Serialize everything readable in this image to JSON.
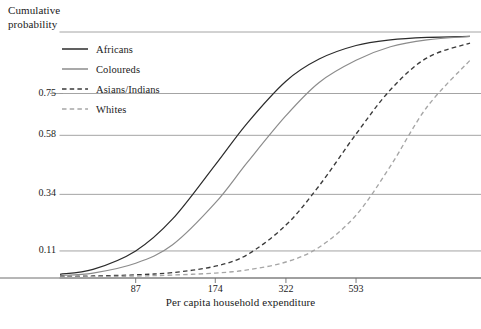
{
  "chart_data": {
    "type": "line",
    "title": "",
    "subtitle": "",
    "ylabel": "Cumulative\nprobability",
    "xlabel": "Per capita household expenditure",
    "grid": true,
    "legend_position": "upper-left-inside",
    "x_scale": "log",
    "x_ticks": [
      87,
      174,
      322,
      593
    ],
    "x_tick_labels": [
      "87",
      "174",
      "322",
      "593"
    ],
    "y_ticks": [
      0.11,
      0.34,
      0.58,
      0.75
    ],
    "y_tick_labels": [
      "0.11",
      "0.34",
      "0.58",
      "0.75"
    ],
    "ylim": [
      0,
      1.0
    ],
    "xlim": [
      45,
      1600
    ],
    "annotations": [],
    "series": [
      {
        "name": "Africans",
        "style": "solid",
        "color": "#2b2b2b",
        "x": [
          45,
          60,
          87,
          120,
          174,
          230,
          322,
          430,
          593,
          800,
          1100,
          1600
        ],
        "y": [
          0.015,
          0.035,
          0.11,
          0.24,
          0.46,
          0.63,
          0.8,
          0.89,
          0.945,
          0.968,
          0.978,
          0.982
        ]
      },
      {
        "name": "Coloureds",
        "style": "solid",
        "color": "#8c8c8c",
        "x": [
          45,
          60,
          87,
          120,
          174,
          230,
          322,
          430,
          593,
          800,
          1100,
          1600
        ],
        "y": [
          0.01,
          0.02,
          0.06,
          0.135,
          0.305,
          0.47,
          0.66,
          0.795,
          0.885,
          0.94,
          0.968,
          0.982
        ]
      },
      {
        "name": "Asians/Indians",
        "style": "dashed",
        "color": "#3a3a3a",
        "x": [
          45,
          60,
          87,
          120,
          174,
          230,
          322,
          430,
          593,
          800,
          1100,
          1600
        ],
        "y": [
          0.006,
          0.008,
          0.013,
          0.022,
          0.048,
          0.095,
          0.215,
          0.375,
          0.585,
          0.765,
          0.895,
          0.955
        ]
      },
      {
        "name": "Whites",
        "style": "dashed",
        "color": "#a6a6a6",
        "x": [
          45,
          60,
          87,
          120,
          174,
          230,
          322,
          430,
          593,
          800,
          1100,
          1600
        ],
        "y": [
          0.004,
          0.005,
          0.008,
          0.012,
          0.02,
          0.033,
          0.065,
          0.125,
          0.255,
          0.455,
          0.695,
          0.885
        ]
      }
    ]
  },
  "axes": {
    "y_title": "Cumulative\nprobability",
    "x_title": "Per capita household expenditure",
    "y_tick_labels": [
      "0.75",
      "0.58",
      "0.34",
      "0.11"
    ],
    "x_tick_labels": [
      "87",
      "174",
      "322",
      "593"
    ]
  },
  "legend": {
    "items": [
      {
        "label": "Africans",
        "style": "solid",
        "color": "#2b2b2b"
      },
      {
        "label": "Coloureds",
        "style": "solid",
        "color": "#8c8c8c"
      },
      {
        "label": "Asians/Indians",
        "style": "dashed",
        "color": "#3a3a3a"
      },
      {
        "label": "Whites",
        "style": "dashed",
        "color": "#a6a6a6"
      }
    ]
  },
  "colors": {
    "grid": "#9a9a9a",
    "axis": "#6e6e6e",
    "text": "#1a1a1a",
    "background": "#ffffff"
  }
}
